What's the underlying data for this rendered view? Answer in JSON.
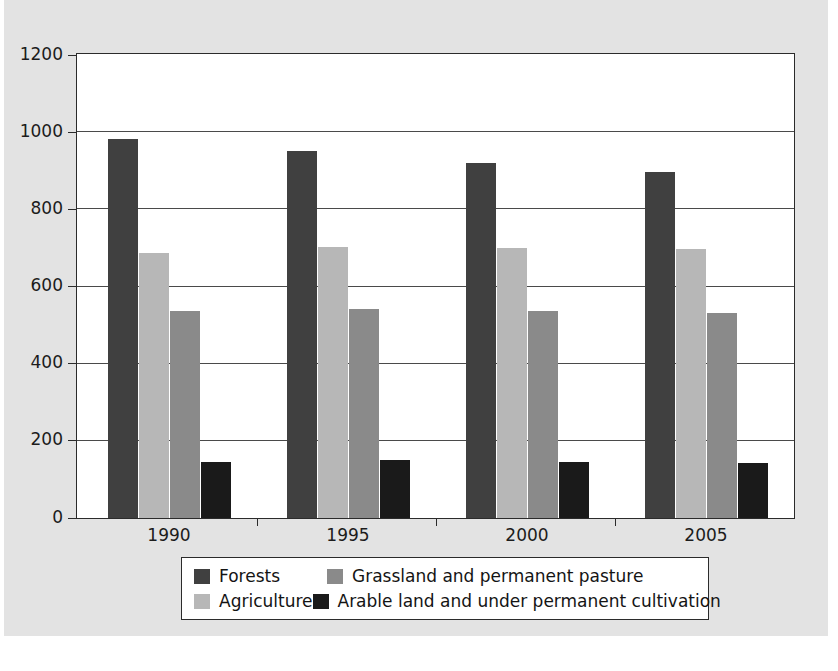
{
  "chart_data": {
    "type": "bar",
    "title": "",
    "subtitle": "",
    "xlabel": "",
    "ylabel": "",
    "categories": [
      "1990",
      "1995",
      "2000",
      "2005"
    ],
    "ylim": [
      0,
      1200
    ],
    "yticks": [
      0,
      200,
      400,
      600,
      800,
      1000,
      1200
    ],
    "ytick_labels": [
      "0",
      "200",
      "400",
      "600",
      "800",
      "1000",
      "1200"
    ],
    "grid": "horizontal",
    "legend_position": "below-axes",
    "series": [
      {
        "name": "Forests",
        "color": "#404040",
        "values": [
          980,
          950,
          920,
          895
        ]
      },
      {
        "name": "Agriculture",
        "color": "#b7b7b7",
        "values": [
          685,
          700,
          698,
          695
        ]
      },
      {
        "name": "Grassland and permanent pasture",
        "color": "#8a8a8a",
        "values": [
          535,
          540,
          535,
          530
        ]
      },
      {
        "name": "Arable land and under permanent cultivation",
        "color": "#1a1a1a",
        "values": [
          145,
          150,
          145,
          140
        ]
      }
    ]
  },
  "axes": {
    "y_tick_labels": [
      "1200",
      "1000",
      "800",
      "600",
      "400",
      "200",
      "0"
    ],
    "x_tick_labels": [
      "1990",
      "1995",
      "2000",
      "2005"
    ]
  },
  "legend": {
    "entries": [
      {
        "label": "Forests",
        "color": "#404040"
      },
      {
        "label": "Grassland and permanent pasture",
        "color": "#8a8a8a"
      },
      {
        "label": "Agriculture",
        "color": "#b7b7b7"
      },
      {
        "label": "Arable land and under permanent cultivation",
        "color": "#1a1a1a"
      }
    ]
  },
  "colors": {
    "page_background": "#ffffff",
    "panel_background": "#e3e3e3",
    "plot_background": "#ffffff",
    "axis_line": "#2b2b2b",
    "gridline": "#4a4a4a",
    "text": "#1c1c1c"
  }
}
